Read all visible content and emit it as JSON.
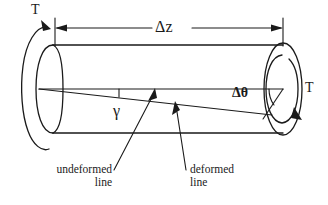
{
  "figure": {
    "type": "engineering-diagram",
    "background_color": "#ffffff",
    "line_color": "#1a1a1a"
  },
  "labels": {
    "torque_left": "T",
    "torque_right": "T",
    "length_dimension": "Δz",
    "twist_angle": "Δθ",
    "shear_strain": "γ",
    "undeformed_line_1": "undeformed",
    "undeformed_line_2": "line",
    "deformed_line_1": "deformed",
    "deformed_line_2": "line"
  },
  "annotations": {
    "undeformed_text": "undeformed line",
    "deformed_text": "deformed line"
  },
  "geometry": {
    "cylinder_left_x": 42,
    "cylinder_right_x": 282,
    "cylinder_top_y": 45,
    "cylinder_bottom_y": 133,
    "axis_y": 89,
    "end_cap_rx": 18,
    "end_cap_ry": 45,
    "dimension_line_y": 28,
    "shear_angle_degrees": 9,
    "twist_angle_degrees": 9
  }
}
